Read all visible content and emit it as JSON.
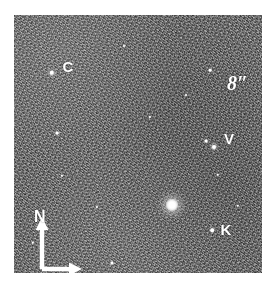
{
  "figure": {
    "kind": "astronomical-field-image",
    "background_color": "#ffffff",
    "field": {
      "left": 14,
      "top": 15,
      "width": 248,
      "height": 258,
      "mean_gray": "#6e6e6e",
      "description": "noisy grayscale sky field"
    }
  },
  "scale_bar": {
    "label": "8″",
    "orientation": "vertical",
    "double_headed": true,
    "color": "#ffffff"
  },
  "compass": {
    "north_label": "N",
    "north_direction": "up",
    "second_arm_direction": "right",
    "second_arm_label": "",
    "color": "#ffffff"
  },
  "sources": [
    {
      "label": "C",
      "marker_x": 52,
      "marker_y": 73,
      "label_x": 68,
      "label_y": 66,
      "radius": 2.2,
      "brightness": "medium"
    },
    {
      "label": "V",
      "marker_x": 214,
      "marker_y": 147,
      "label_x": 229,
      "label_y": 138,
      "radius": 2.0,
      "brightness": "medium"
    },
    {
      "label": "K",
      "marker_x": 212,
      "marker_y": 230,
      "label_x": 226,
      "label_y": 229,
      "radius": 1.8,
      "brightness": "faint"
    }
  ],
  "bright_source": {
    "x": 172,
    "y": 205,
    "label": "",
    "brightness": "bright"
  },
  "field_stars": [
    {
      "x": 57,
      "y": 133,
      "r": 1.4,
      "brightness": "faint"
    },
    {
      "x": 210,
      "y": 70,
      "r": 1.3,
      "brightness": "faint"
    },
    {
      "x": 206,
      "y": 141,
      "r": 1.4,
      "brightness": "faint"
    },
    {
      "x": 218,
      "y": 175,
      "r": 1.2,
      "brightness": "faint"
    },
    {
      "x": 62,
      "y": 176,
      "r": 1.2,
      "brightness": "faint"
    },
    {
      "x": 112,
      "y": 263,
      "r": 1.5,
      "brightness": "faint"
    },
    {
      "x": 150,
      "y": 117,
      "r": 1.1,
      "brightness": "faint"
    },
    {
      "x": 97,
      "y": 207,
      "r": 1.1,
      "brightness": "faint"
    },
    {
      "x": 238,
      "y": 206,
      "r": 1.2,
      "brightness": "faint"
    },
    {
      "x": 33,
      "y": 243,
      "r": 1.2,
      "brightness": "faint"
    },
    {
      "x": 186,
      "y": 95,
      "r": 1.0,
      "brightness": "faint"
    },
    {
      "x": 124,
      "y": 46,
      "r": 1.0,
      "brightness": "faint"
    }
  ]
}
